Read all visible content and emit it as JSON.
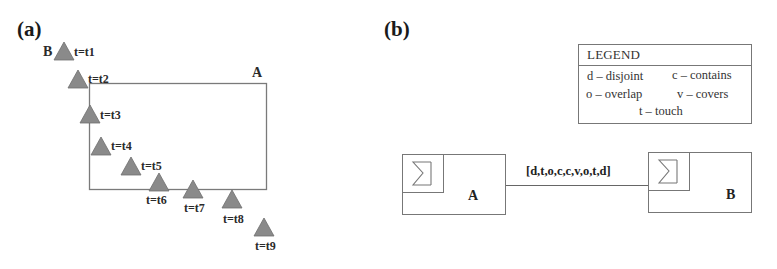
{
  "panel_a": {
    "label": "(a)",
    "region_label": "A",
    "moving_object_label": "B",
    "positions": [
      {
        "label": "t=t1"
      },
      {
        "label": "t=t2"
      },
      {
        "label": "t=t3"
      },
      {
        "label": "t=t4"
      },
      {
        "label": "t=t5"
      },
      {
        "label": "t=t6"
      },
      {
        "label": "t=t7"
      },
      {
        "label": "t=t8"
      },
      {
        "label": "t=t9"
      }
    ],
    "colors": {
      "triangle_fill": "#8a8a8a",
      "triangle_stroke": "#6e6e6e",
      "rect_stroke": "#7a7a7a"
    }
  },
  "panel_b": {
    "label": "(b)",
    "legend": {
      "title": "LEGEND",
      "items": [
        {
          "code": "d",
          "text": "d – disjoint"
        },
        {
          "code": "c",
          "text": "c – contains"
        },
        {
          "code": "o",
          "text": "o – overlap"
        },
        {
          "code": "v",
          "text": "v – covers"
        },
        {
          "code": "t",
          "text": "t – touch"
        }
      ]
    },
    "entities": [
      {
        "name": "A",
        "icon": "sigma-icon"
      },
      {
        "name": "B",
        "icon": "sigma-icon"
      }
    ],
    "relation": {
      "label": "[d,t,o,c,c,v,o,t,d]"
    }
  }
}
